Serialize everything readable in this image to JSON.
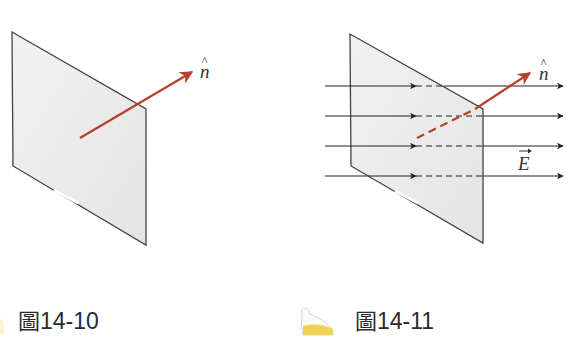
{
  "figures": [
    {
      "id": "left",
      "caption": {
        "prefix": "圖",
        "number": "14-10"
      },
      "normal_label": "n̂",
      "normal_symbol": "n",
      "normal_hat": "^",
      "plate": {
        "fill": "#e9e9e9",
        "stroke": "#444444"
      },
      "normal_color": "#b5412c"
    },
    {
      "id": "right",
      "caption": {
        "prefix": "圖",
        "number": "14-11"
      },
      "normal_label": "n̂",
      "normal_symbol": "n",
      "normal_hat": "^",
      "field_label": "E",
      "field_arrow": "→",
      "field_lines": 4,
      "plate": {
        "fill": "#e9e9e9",
        "stroke": "#444444"
      },
      "normal_color": "#b5412c",
      "field_color": "#333333"
    }
  ],
  "colors": {
    "plate_fill": "#e9e9e9",
    "plate_stroke": "#444444",
    "normal": "#b5412c",
    "field": "#333333",
    "text": "#2b2b2b"
  }
}
